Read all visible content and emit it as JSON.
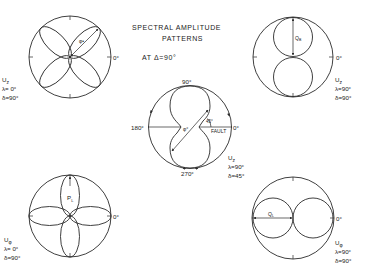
{
  "title": {
    "line1": "SPECTRAL  AMPLITUDE",
    "line2": "PATTERNS",
    "line3": "AT Δ=90°"
  },
  "colors": {
    "ink": "#2a2a2a",
    "background": "#ffffff"
  },
  "diagrams": [
    {
      "id": "top-left",
      "pattern": "four-lobe rose rotated 45°",
      "component": "U",
      "component_sub": "z",
      "lambda": "λ= 0°",
      "delta": "δ=90°",
      "axis_label": "0°",
      "measure_label": "φ•"
    },
    {
      "id": "top-right",
      "pattern": "vertical figure-eight (two circles)",
      "component": "U",
      "component_sub": "z",
      "lambda": "λ=90°",
      "delta": "δ=90°",
      "axis_label": "0°",
      "measure_label": "Q",
      "measure_sub": "B"
    },
    {
      "id": "center",
      "pattern": "tilted figure-eight",
      "component": "U",
      "component_sub": "z",
      "lambda": "λ=90°",
      "delta": "δ=45°",
      "axis_labels": {
        "top": "90°",
        "left": "180°",
        "right": "0°",
        "bottom": "270°"
      },
      "angle_label": "45°",
      "fault_label": "FAULT",
      "measure_label": "φ°"
    },
    {
      "id": "bottom-left",
      "pattern": "four-lobe rose on axes",
      "component": "U",
      "component_sub": "φ",
      "lambda": "λ= 0°",
      "delta": "δ=90°",
      "axis_label": "0°",
      "measure_label": "P",
      "measure_sub": "L"
    },
    {
      "id": "bottom-right",
      "pattern": "horizontal figure-eight (two circles)",
      "component": "U",
      "component_sub": "φ",
      "lambda": "λ=90°",
      "delta": "δ=90°",
      "axis_label": "0°",
      "measure_label": "Q",
      "measure_sub": "L"
    }
  ]
}
